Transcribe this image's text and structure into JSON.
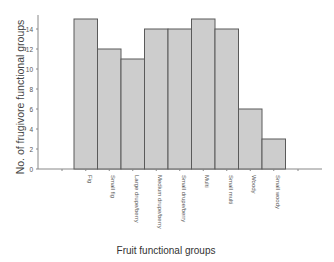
{
  "chart_data": {
    "type": "bar",
    "title": "",
    "xlabel": "Fruit functional groups",
    "ylabel": "No. of frugivore functional groups",
    "categories": [
      "Fig",
      "Small fig",
      "Large drupe/berry",
      "Medium drupe/berry",
      "Small drupe/berry",
      "Multi",
      "Small multi",
      "Woody",
      "Small woody"
    ],
    "values": [
      15,
      12,
      11,
      14,
      14,
      15,
      14,
      6,
      3
    ],
    "ylim": [
      0,
      15
    ],
    "yticks": [
      0,
      2,
      4,
      6,
      8,
      10,
      12,
      14
    ],
    "grid": false,
    "legend": null,
    "colors": {
      "bar_fill": "#cdcdcd",
      "bar_stroke": "#5a5a5a",
      "axis": "#888888",
      "text": "#444444"
    }
  }
}
